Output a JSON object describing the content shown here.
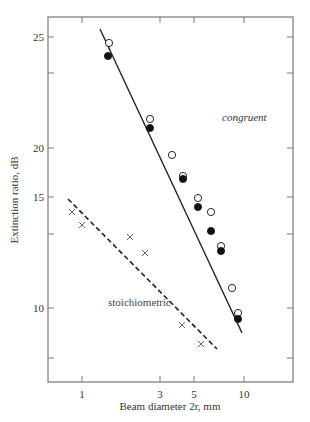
{
  "chart_data": {
    "type": "scatter",
    "title": "",
    "xlabel": "Beam diameter 2r, mm",
    "ylabel": "Extinction ratio, dB",
    "xscale": "log",
    "xlim": [
      0.62,
      25
    ],
    "x_ticks": [
      {
        "value": 1,
        "label": "1",
        "px": 82
      },
      {
        "value": 3,
        "label": "3",
        "px": 160
      },
      {
        "value": 5,
        "label": "5",
        "px": 194
      },
      {
        "value": 10,
        "label": "10",
        "px": 244
      }
    ],
    "y_ticks": [
      {
        "value": 25,
        "label": "25",
        "px": 37
      },
      {
        "value": null,
        "label": "",
        "px": 73
      },
      {
        "value": 20,
        "label": "20",
        "px": 148
      },
      {
        "value": 15,
        "label": "15",
        "px": 197
      },
      {
        "value": null,
        "label": "",
        "px": 234
      },
      {
        "value": 10,
        "label": "10",
        "px": 308
      },
      {
        "value": null,
        "label": "",
        "px": 358
      }
    ],
    "top_ticks_px": [
      82,
      160,
      194,
      244
    ],
    "right_ticks_px": [
      37,
      73,
      148,
      197,
      234,
      308,
      358
    ],
    "grid": false,
    "legend": "inline labels",
    "series": [
      {
        "name": "congruent (open circles)",
        "marker": "open-circle",
        "points": [
          {
            "x": 1.5,
            "y": 24.7,
            "px": [
              109,
              43
            ]
          },
          {
            "x": 2.67,
            "y": 21.3,
            "px": [
              150,
              119
            ]
          },
          {
            "x": 3.65,
            "y": 19.4,
            "px": [
              172,
              155
            ]
          },
          {
            "x": 4.3,
            "y": 17.3,
            "px": [
              183,
              176
            ]
          },
          {
            "x": 5.3,
            "y": 15.1,
            "px": [
              198,
              198
            ]
          },
          {
            "x": 6.4,
            "y": 14.4,
            "px": [
              211,
              212
            ]
          },
          {
            "x": 7.4,
            "y": 12.8,
            "px": [
              221,
              246
            ]
          },
          {
            "x": 8.6,
            "y": 11.0,
            "px": [
              232,
              288
            ]
          },
          {
            "x": 9.4,
            "y": 9.9,
            "px": [
              238,
              313
            ]
          }
        ]
      },
      {
        "name": "congruent (filled circles)",
        "marker": "filled-circle",
        "points": [
          {
            "x": 1.48,
            "y": 24.2,
            "px": [
              108,
              56
            ]
          },
          {
            "x": 2.67,
            "y": 20.9,
            "px": [
              150,
              128
            ]
          },
          {
            "x": 4.3,
            "y": 16.9,
            "px": [
              183,
              179
            ]
          },
          {
            "x": 5.3,
            "y": 14.6,
            "px": [
              198,
              207
            ]
          },
          {
            "x": 6.4,
            "y": 13.5,
            "px": [
              211,
              231
            ]
          },
          {
            "x": 7.4,
            "y": 12.6,
            "px": [
              221,
              251
            ]
          },
          {
            "x": 9.4,
            "y": 9.6,
            "px": [
              238,
              319
            ]
          }
        ]
      },
      {
        "name": "stoichiometric",
        "marker": "cross",
        "points": [
          {
            "x": 0.87,
            "y": 14.3,
            "px": [
              72,
              212
            ]
          },
          {
            "x": 1.0,
            "y": 13.7,
            "px": [
              82,
              225
            ]
          },
          {
            "x": 1.98,
            "y": 13.1,
            "px": [
              130,
              237
            ]
          },
          {
            "x": 2.45,
            "y": 12.4,
            "px": [
              145,
              253
            ]
          },
          {
            "x": 4.3,
            "y": 10.2,
            "px": [
              182,
              325
            ]
          },
          {
            "x": 5.4,
            "y": 9.7,
            "px": [
              201,
              344
            ]
          }
        ]
      }
    ],
    "fit_lines": [
      {
        "name": "congruent",
        "style": "solid",
        "from_px": [
          100,
          29
        ],
        "to_px": [
          242,
          333
        ]
      },
      {
        "name": "stoichiometric",
        "style": "dashed",
        "from_px": [
          68,
          199
        ],
        "to_px": [
          217,
          349
        ]
      }
    ],
    "annotations": [
      {
        "text": "congruent",
        "italic": true,
        "px": [
          222,
          121
        ]
      },
      {
        "text": "stoichiometric",
        "italic": false,
        "px": [
          108,
          306
        ]
      }
    ],
    "colors": {
      "axis": "#777777",
      "line": "#222222",
      "marker": "#111111",
      "text": "#333333"
    }
  }
}
